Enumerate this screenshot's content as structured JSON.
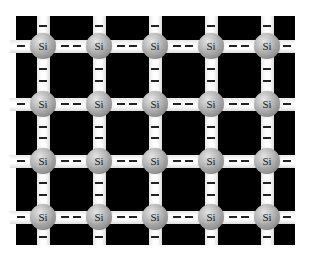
{
  "diagram": {
    "colors": {
      "background": "#ffffff",
      "backdrop": "#000000",
      "bond": "#ffffff",
      "electron": "#222222",
      "atom": "#a0a0a0",
      "label": "#1a1a1a"
    },
    "grid": {
      "rows": 4,
      "cols": 5,
      "col_x": [
        43,
        99,
        155,
        211,
        267
      ],
      "row_y": [
        46,
        104,
        161,
        217
      ],
      "backdrop": {
        "left": 16,
        "top": 16,
        "right": 295,
        "bottom": 245
      },
      "edge_left": 10,
      "edge_right": 295,
      "edge_top": 16,
      "edge_bottom": 245
    },
    "atom_label": "Si",
    "electrons_per_bond": 2,
    "electron_symbol": "–",
    "atoms": [
      {
        "row": 0,
        "col": 0,
        "label": "Si"
      },
      {
        "row": 0,
        "col": 1,
        "label": "Si"
      },
      {
        "row": 0,
        "col": 2,
        "label": "Si"
      },
      {
        "row": 0,
        "col": 3,
        "label": "Si"
      },
      {
        "row": 0,
        "col": 4,
        "label": "Si"
      },
      {
        "row": 1,
        "col": 0,
        "label": "Si"
      },
      {
        "row": 1,
        "col": 1,
        "label": "Si"
      },
      {
        "row": 1,
        "col": 2,
        "label": "Si"
      },
      {
        "row": 1,
        "col": 3,
        "label": "Si"
      },
      {
        "row": 1,
        "col": 4,
        "label": "Si"
      },
      {
        "row": 2,
        "col": 0,
        "label": "Si"
      },
      {
        "row": 2,
        "col": 1,
        "label": "Si"
      },
      {
        "row": 2,
        "col": 2,
        "label": "Si"
      },
      {
        "row": 2,
        "col": 3,
        "label": "Si"
      },
      {
        "row": 2,
        "col": 4,
        "label": "Si"
      },
      {
        "row": 3,
        "col": 0,
        "label": "Si"
      },
      {
        "row": 3,
        "col": 1,
        "label": "Si"
      },
      {
        "row": 3,
        "col": 2,
        "label": "Si"
      },
      {
        "row": 3,
        "col": 3,
        "label": "Si"
      },
      {
        "row": 3,
        "col": 4,
        "label": "Si"
      }
    ]
  }
}
